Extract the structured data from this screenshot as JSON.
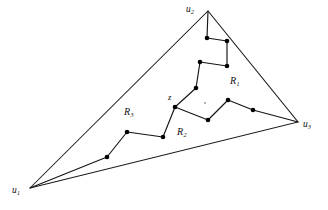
{
  "figure": {
    "kind": "planar-graph-diagram",
    "background_color": "#ffffff",
    "ink_color": "#111111"
  },
  "vertices": [
    {
      "id": "u1",
      "base": "u",
      "subscript": "1",
      "x": 30,
      "y": 188,
      "label_x": 12,
      "label_y": 186
    },
    {
      "id": "u2",
      "base": "u",
      "subscript": "2",
      "x": 208,
      "y": 11,
      "label_x": 186,
      "label_y": 5
    },
    {
      "id": "u3",
      "base": "u",
      "subscript": "3",
      "x": 298,
      "y": 122,
      "label_x": 303,
      "label_y": 120
    }
  ],
  "region_labels": [
    {
      "id": "R1",
      "base": "R",
      "subscript": "1",
      "x": 230,
      "y": 76
    },
    {
      "id": "R2",
      "base": "R",
      "subscript": "2",
      "x": 177,
      "y": 127
    },
    {
      "id": "R3",
      "base": "R",
      "subscript": "3",
      "x": 124,
      "y": 107
    }
  ],
  "point_labels": [
    {
      "id": "z",
      "text": "z",
      "x": 168,
      "y": 93
    }
  ],
  "triangle": {
    "outline_points": "30,188 208,11 298,122 30,188",
    "edges": [
      {
        "name": "edge-u1-u2",
        "from": "u1",
        "to": "u2"
      },
      {
        "name": "edge-u2-u3",
        "from": "u2",
        "to": "u3"
      },
      {
        "name": "edge-u3-u1",
        "from": "u3",
        "to": "u1"
      }
    ]
  },
  "interior_tree": {
    "center_node": {
      "id": "z",
      "x": 175,
      "y": 107
    },
    "branches": [
      {
        "name": "branch-to-u2",
        "bounds_regions": [
          "R1",
          "R3"
        ],
        "polyline": "175,107 196,88 200,62 227,66 227,41 207,38 208,11"
      },
      {
        "name": "branch-to-u3",
        "bounds_regions": [
          "R1",
          "R2"
        ],
        "polyline": "175,107 208,120 228,100 253,110 298,122"
      },
      {
        "name": "branch-to-u1",
        "bounds_regions": [
          "R2",
          "R3"
        ],
        "polyline": "175,107 163,137 127,132 107,157 30,188"
      }
    ],
    "nodes": [
      {
        "x": 175,
        "y": 107,
        "r": 2.3
      },
      {
        "x": 196,
        "y": 88,
        "r": 2.3
      },
      {
        "x": 200,
        "y": 62,
        "r": 2.3
      },
      {
        "x": 227,
        "y": 66,
        "r": 2.3
      },
      {
        "x": 227,
        "y": 41,
        "r": 2.3
      },
      {
        "x": 207,
        "y": 38,
        "r": 2.3
      },
      {
        "x": 208,
        "y": 120,
        "r": 2.3
      },
      {
        "x": 228,
        "y": 100,
        "r": 2.3
      },
      {
        "x": 253,
        "y": 110,
        "r": 2.3
      },
      {
        "x": 163,
        "y": 137,
        "r": 2.3
      },
      {
        "x": 127,
        "y": 132,
        "r": 2.3
      },
      {
        "x": 107,
        "y": 157,
        "r": 2.3
      }
    ],
    "speck": {
      "x": 205,
      "y": 103,
      "r": 0.9
    }
  }
}
